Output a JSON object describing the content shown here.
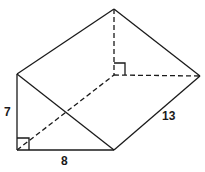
{
  "figure": {
    "type": "triangular prism",
    "labels": {
      "height": "7",
      "base": "8",
      "length": "13"
    },
    "colors": {
      "stroke": "#1a1a1a",
      "background": "#ffffff"
    }
  }
}
